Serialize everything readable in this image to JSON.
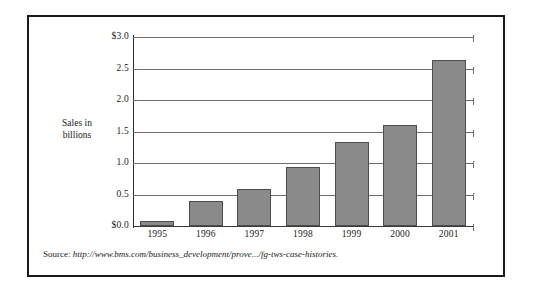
{
  "figure": {
    "source_label": "Source:",
    "source_url": "http://www.bms.com/business_development/prove.../fg-tws-case-histories.",
    "frame_color": "#1a1a1a"
  },
  "axis": {
    "y_title_line1": "Sales in",
    "y_title_line2": "billions"
  },
  "chart_data": {
    "type": "bar",
    "title": "",
    "subtitle": "",
    "xlabel": "",
    "ylabel": "Sales in billions",
    "categories": [
      "1995",
      "1996",
      "1997",
      "1998",
      "1999",
      "2000",
      "2001"
    ],
    "values": [
      0.08,
      0.4,
      0.58,
      0.94,
      1.33,
      1.61,
      2.63
    ],
    "ylim": [
      0.0,
      3.0
    ],
    "ytick_values": [
      0.0,
      0.5,
      1.0,
      1.5,
      2.0,
      2.5,
      3.0
    ],
    "ytick_labels": [
      "$0.0",
      "0.5",
      "1.0",
      "1.5",
      "2.0",
      "2.5",
      "$3.0"
    ],
    "grid": true,
    "legend": false,
    "legend_position": "none",
    "bar_fill_color": "#8a8a8a",
    "bar_edge_color": "#4d4d4d",
    "gridline_color": "#6e6e6e",
    "axis_color": "#2a2a2a",
    "annotations": []
  }
}
